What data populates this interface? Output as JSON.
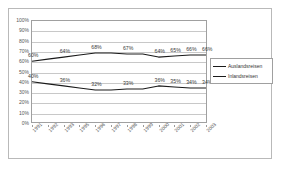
{
  "chart_data": {
    "type": "line",
    "title": "",
    "subtitle": "",
    "xlabel": "",
    "ylabel": "",
    "ylim": [
      0,
      100
    ],
    "grid": true,
    "legend_position": "right",
    "categories": [
      "1991",
      "1992",
      "1993",
      "1995",
      "1996",
      "1997",
      "1998",
      "1999",
      "2000",
      "2001",
      "2002",
      "2003"
    ],
    "ytick_labels": [
      "100%",
      "90%",
      "80%",
      "70%",
      "60%",
      "50%",
      "40%",
      "30%",
      "20%",
      "10%",
      "0%"
    ],
    "ytick_values": [
      100,
      90,
      80,
      70,
      60,
      50,
      40,
      30,
      20,
      10,
      0
    ],
    "series": [
      {
        "name": "Auslandsreisen",
        "color": "#1a1a1a",
        "values": [
          60,
          62,
          64,
          66,
          68,
          68,
          67,
          67,
          64,
          65,
          66,
          66
        ],
        "point_labels": [
          "60%",
          "",
          "64%",
          "",
          "68%",
          "",
          "67%",
          "",
          "64%",
          "65%",
          "66%",
          "66%"
        ]
      },
      {
        "name": "Inlandsreisen",
        "color": "#1a1a1a",
        "values": [
          40,
          38,
          36,
          34,
          32,
          32,
          33,
          33,
          36,
          35,
          34,
          34
        ],
        "point_labels": [
          "40%",
          "",
          "36%",
          "",
          "32%",
          "",
          "33%",
          "",
          "36%",
          "35%",
          "34%",
          "34%"
        ]
      }
    ]
  },
  "legend": {
    "entries": [
      {
        "label": "Auslandsreisen"
      },
      {
        "label": "Inlandsreisen"
      }
    ]
  }
}
